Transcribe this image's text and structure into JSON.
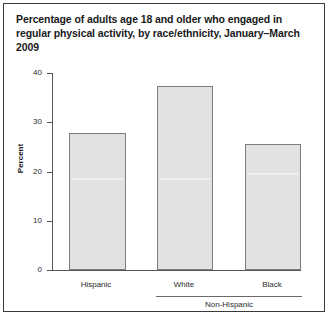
{
  "figure": {
    "title": "Percentage of adults age 18 and older who engaged in regular physical activity, by race/ethnicity, January–March 2009"
  },
  "chart_data": {
    "type": "bar",
    "title": "Percentage of adults age 18 and older who engaged in regular physical activity, by race/ethnicity, January–March 2009",
    "categories": [
      "Hispanic",
      "White",
      "Black"
    ],
    "values": [
      27.8,
      37.3,
      25.5
    ],
    "series": [
      {
        "name": "Percent engaged in regular physical activity",
        "values": [
          27.8,
          37.3,
          25.5
        ]
      }
    ],
    "xlabel": "",
    "ylabel": "Percent",
    "ylim": [
      0,
      40
    ],
    "yticks": [
      0,
      10,
      20,
      30,
      40
    ],
    "ytick_labels": [
      "0",
      "10",
      "20",
      "30",
      "40"
    ],
    "grid": false,
    "legend": false,
    "annotations": [
      {
        "text": "Non-Hispanic",
        "covers": [
          "White",
          "Black"
        ],
        "type": "group-bracket"
      }
    ],
    "colors": {
      "bar_fill": "#e2e2e2",
      "bar_border": "#7d7d7d",
      "axis": "#555555",
      "text": "#1a1a1a",
      "frame": "#3a3a3a"
    }
  },
  "axis": {
    "y_title": "Percent",
    "ticks": [
      {
        "label": "40",
        "value": 40
      },
      {
        "label": "30",
        "value": 30
      },
      {
        "label": "20",
        "value": 20
      },
      {
        "label": "10",
        "value": 10
      },
      {
        "label": "0",
        "value": 0
      }
    ]
  },
  "group": {
    "bracket_label": "Non-Hispanic"
  },
  "bottom": {
    "cut_text": ""
  }
}
